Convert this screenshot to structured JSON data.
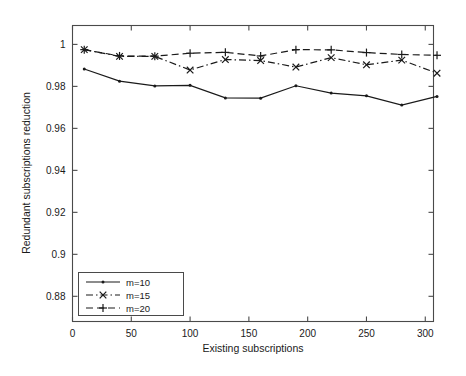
{
  "chart_data": {
    "type": "line",
    "title": "",
    "xlabel": "Existing subscriptions",
    "ylabel": "Redundant subscriptions reduction",
    "xlim": [
      0,
      307
    ],
    "ylim": [
      0.868,
      1.009
    ],
    "grid": false,
    "legend_position": "lower-left",
    "xticks": [
      0,
      50,
      100,
      150,
      200,
      250,
      300
    ],
    "xtick_labels": [
      "0",
      "50",
      "100",
      "150",
      "200",
      "250",
      "300"
    ],
    "yticks": [
      0.88,
      0.9,
      0.92,
      0.94,
      0.96,
      0.98,
      1
    ],
    "ytick_labels": [
      "0.88",
      "0.9",
      "0.92",
      "0.94",
      "0.96",
      "0.98",
      "1"
    ],
    "x": [
      10,
      40,
      70,
      100,
      130,
      160,
      190,
      220,
      250,
      280,
      310
    ],
    "series": [
      {
        "name": "m=10",
        "linestyle": "solid",
        "marker": "dot",
        "color": "#1a1a1a",
        "values": [
          0.9883,
          0.9825,
          0.9802,
          0.9805,
          0.9745,
          0.9744,
          0.9803,
          0.9768,
          0.9755,
          0.9711,
          0.9752
        ]
      },
      {
        "name": "m=15",
        "linestyle": "dashdot",
        "marker": "x",
        "color": "#1a1a1a",
        "values": [
          0.9975,
          0.9943,
          0.9943,
          0.9878,
          0.9928,
          0.9923,
          0.9892,
          0.9937,
          0.9903,
          0.9925,
          0.9863
        ]
      },
      {
        "name": "m=20",
        "linestyle": "dashed",
        "marker": "plus",
        "color": "#1a1a1a",
        "values": [
          0.9975,
          0.9945,
          0.9944,
          0.9958,
          0.9962,
          0.9945,
          0.9975,
          0.9974,
          0.9961,
          0.9952,
          0.9948
        ]
      }
    ]
  },
  "legend": {
    "entries": [
      {
        "label": "m=10"
      },
      {
        "label": "m=15"
      },
      {
        "label": "m=20"
      }
    ]
  }
}
